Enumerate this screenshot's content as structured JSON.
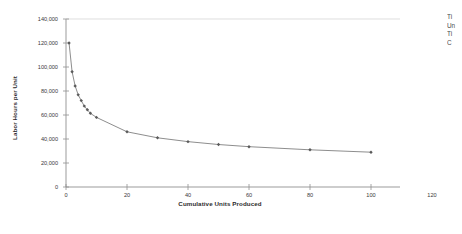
{
  "chart_data": {
    "type": "line",
    "title": "",
    "subtitle": "",
    "xlabel": "Cumulative Units Produced",
    "ylabel": "Labor Hours per Unit",
    "xlim": [
      0,
      120
    ],
    "ylim": [
      0,
      140000
    ],
    "xticks": [
      0,
      20,
      40,
      60,
      80,
      100,
      120
    ],
    "xtick_labels": [
      "0",
      "20",
      "40",
      "60",
      "80",
      "100",
      "120"
    ],
    "yticks": [
      0,
      20000,
      40000,
      60000,
      80000,
      100000,
      120000,
      140000
    ],
    "ytick_labels": [
      "0",
      "20,000",
      "40,000",
      "60,000",
      "80,000",
      "100,000",
      "120,000",
      "140,000"
    ],
    "grid": false,
    "legend": null,
    "marker": "diamond",
    "line_color": "#808080",
    "marker_color": "#5a5a5a",
    "series": [
      {
        "name": "Labor Hours per Unit",
        "x": [
          1,
          2,
          3,
          4,
          5,
          6,
          7,
          8,
          10,
          20,
          30,
          40,
          50,
          60,
          80,
          100
        ],
        "values": [
          120000,
          96000,
          84200,
          76800,
          72000,
          67400,
          64400,
          61400,
          58000,
          46000,
          41000,
          37800,
          35400,
          33600,
          31000,
          29000
        ]
      }
    ]
  },
  "side_note": {
    "lines": [
      "Ti",
      "Un",
      "Ti",
      "C"
    ]
  }
}
